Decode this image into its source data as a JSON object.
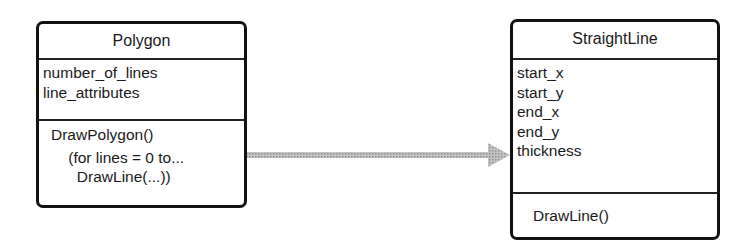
{
  "diagram": {
    "type": "UML class diagram",
    "classes": [
      {
        "name": "Polygon",
        "attributes": [
          "number_of_lines",
          "line_attributes"
        ],
        "operations": [
          "DrawPolygon()",
          "    (for lines = 0 to...",
          "      DrawLine(...))"
        ]
      },
      {
        "name": "StraightLine",
        "attributes": [
          "start_x",
          "start_y",
          "end_x",
          "end_y",
          "thickness"
        ],
        "operations": [
          "DrawLine()"
        ]
      }
    ],
    "relationships": [
      {
        "from": "Polygon",
        "to": "StraightLine",
        "kind": "association-arrow",
        "color": "#b0b0b0"
      }
    ]
  }
}
